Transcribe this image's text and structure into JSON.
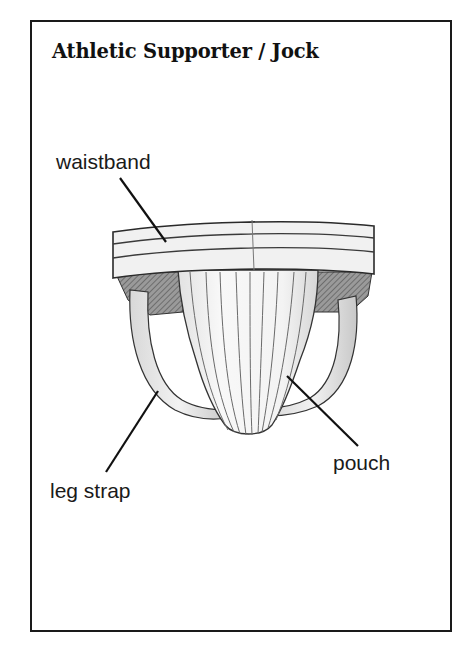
{
  "figure": {
    "title": "Athletic Supporter / Jock",
    "labels": {
      "waistband": "waistband",
      "pouch": "pouch",
      "leg_strap": "leg strap"
    }
  },
  "colors": {
    "ink": "#1a1a1a",
    "shade": "#8a8a8a",
    "fabric": "#f4f4f4",
    "background": "#ffffff"
  }
}
